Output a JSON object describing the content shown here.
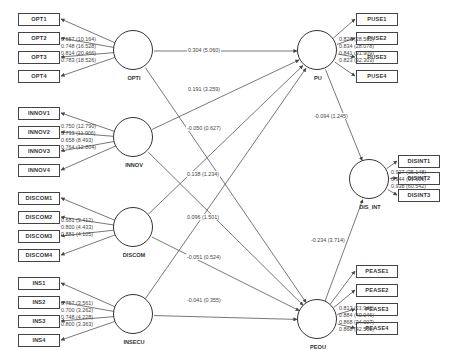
{
  "latent": {
    "OPTI": {
      "label": "OPTI",
      "x": 114,
      "y": 31
    },
    "INNOV": {
      "label": "INNOV",
      "x": 114,
      "y": 118
    },
    "DISCOM": {
      "label": "DISCOM",
      "x": 114,
      "y": 208
    },
    "INSECU": {
      "label": "INSECU",
      "x": 114,
      "y": 295
    },
    "PU": {
      "label": "PU",
      "x": 298,
      "y": 31
    },
    "DIS_INT": {
      "label": "DIS_INT",
      "x": 350,
      "y": 160
    },
    "PEOU": {
      "label": "PEOU",
      "x": 298,
      "y": 300
    }
  },
  "indicators": {
    "OPTI": [
      {
        "label": "OPT1",
        "x": 18,
        "y": 13
      },
      {
        "label": "OPT2",
        "x": 18,
        "y": 32
      },
      {
        "label": "OPT3",
        "x": 18,
        "y": 51
      },
      {
        "label": "OPT4",
        "x": 18,
        "y": 70
      }
    ],
    "INNOV": [
      {
        "label": "INNOV1",
        "x": 18,
        "y": 107
      },
      {
        "label": "INNOV2",
        "x": 18,
        "y": 126
      },
      {
        "label": "INNOV3",
        "x": 18,
        "y": 145
      },
      {
        "label": "INNOV4",
        "x": 18,
        "y": 164
      }
    ],
    "DISCOM": [
      {
        "label": "DISCOM1",
        "x": 18,
        "y": 192
      },
      {
        "label": "DISCOM2",
        "x": 18,
        "y": 211
      },
      {
        "label": "DISCOM3",
        "x": 18,
        "y": 230
      },
      {
        "label": "DISCOM4",
        "x": 18,
        "y": 249
      }
    ],
    "INSECU": [
      {
        "label": "INS1",
        "x": 18,
        "y": 277
      },
      {
        "label": "INS2",
        "x": 18,
        "y": 296
      },
      {
        "label": "INS3",
        "x": 18,
        "y": 315
      },
      {
        "label": "INS4",
        "x": 18,
        "y": 334
      }
    ],
    "PU": [
      {
        "label": "PUSE1",
        "x": 356,
        "y": 13
      },
      {
        "label": "PUSE2",
        "x": 356,
        "y": 32
      },
      {
        "label": "PUSE3",
        "x": 356,
        "y": 51
      },
      {
        "label": "PUSE4",
        "x": 356,
        "y": 70
      }
    ],
    "DIS_INT": [
      {
        "label": "DISINT1",
        "x": 398,
        "y": 155
      },
      {
        "label": "DISINT2",
        "x": 398,
        "y": 172
      },
      {
        "label": "DISINT3",
        "x": 398,
        "y": 189
      }
    ],
    "PEOU": [
      {
        "label": "PEASE1",
        "x": 356,
        "y": 265
      },
      {
        "label": "PEASE2",
        "x": 356,
        "y": 284
      },
      {
        "label": "PEASE3",
        "x": 356,
        "y": 303
      },
      {
        "label": "PEASE4",
        "x": 356,
        "y": 322
      }
    ]
  },
  "loadings": {
    "OPTI": [
      "0.657 (10.164)",
      "0.748 (16.528)",
      "0.814 (20.466)",
      "0.783 (18.526)"
    ],
    "INNOV": [
      "0.750 (12.790)",
      "0.733 (11.906)",
      "0.658 (8.493)",
      "0.764 (12.804)"
    ],
    "DISCOM": [
      "0.681 (3.412)",
      "0.800 (4.433)",
      "0.881 (4.105)"
    ],
    "INSECU": [
      "0.757 (3.561)",
      "0.700 (3.262)",
      "0.748 (4.228)",
      "0.800 (3.363)"
    ],
    "PU": [
      "0.826 (28.582)",
      "0.834 (28.078)",
      "0.841 (31.909)",
      "0.823 (32.303)"
    ],
    "DIS_INT": [
      "0.927 (35.148)",
      "0.944 (99.606)",
      "0.938 (60.542)"
    ],
    "PEOU": [
      "0.813 (21.946)",
      "0.884 (40.046)",
      "0.868 (34.007)",
      "0.868 (42.590)"
    ]
  },
  "paths": [
    {
      "from": "OPTI",
      "to": "PU",
      "label": "0.304 (5.060)",
      "lx": 187,
      "ly": 47
    },
    {
      "from": "INNOV",
      "to": "PU",
      "label": "0.191 (3.259)",
      "lx": 187,
      "ly": 86
    },
    {
      "from": "DISCOM",
      "to": "PU",
      "label": "-0.050 (0.627)",
      "lx": 186,
      "ly": 125
    },
    {
      "from": "INSECU",
      "to": "PU",
      "label": "0.138 (1.234)",
      "lx": 186,
      "ly": 171
    },
    {
      "from": "OPTI",
      "to": "PEOU",
      "label": "",
      "lx": 0,
      "ly": 0
    },
    {
      "from": "INNOV",
      "to": "PEOU",
      "label": "0.096 (1.501)",
      "lx": 186,
      "ly": 214
    },
    {
      "from": "DISCOM",
      "to": "PEOU",
      "label": "-0.051 (0.524)",
      "lx": 186,
      "ly": 254
    },
    {
      "from": "INSECU",
      "to": "PEOU",
      "label": "-0.041 (0.355)",
      "lx": 186,
      "ly": 297
    },
    {
      "from": "PU",
      "to": "DIS_INT",
      "label": "-0.094 (1.245)",
      "lx": 313,
      "ly": 113
    },
    {
      "from": "PEOU",
      "to": "DIS_INT",
      "label": "-0.234 (3.714)",
      "lx": 310,
      "ly": 237
    }
  ],
  "colors": {
    "line": "#555555",
    "box_border": "#444444",
    "circle_border": "#333333",
    "text": "#333333"
  }
}
